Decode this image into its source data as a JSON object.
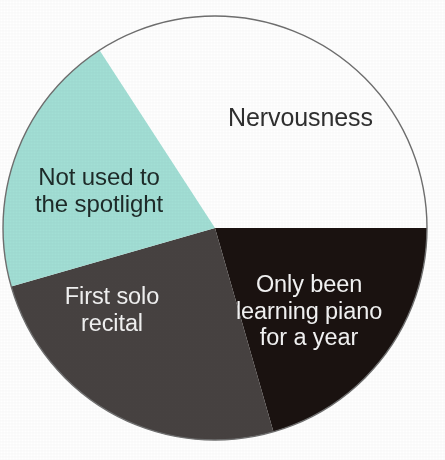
{
  "chart_data": {
    "type": "pie",
    "title": "",
    "subtitle": "",
    "xlabel": "",
    "ylabel": "",
    "legend_position": "none",
    "labels_inside_slices": true,
    "grid": false,
    "background_color": "#ffffff",
    "center": {
      "x": 215,
      "y": 228
    },
    "radius": 212,
    "outline_color": "#6f6f6f",
    "categories": [
      "Nervousness",
      "Only been learning piano for a year",
      "First solo recital",
      "Not used to the spotlight"
    ],
    "values": [
      34.2,
      20.6,
      25.0,
      20.2
    ],
    "slices": [
      {
        "label": "Nervousness",
        "label_lines": "Nervousness",
        "value": 34.2,
        "start_angle": 327,
        "end_angle": 90,
        "sweep": 123,
        "fill": "#ffffff",
        "text_color": "#2f2f2f",
        "has_outline": true
      },
      {
        "label": "Only been learning piano for a year",
        "label_lines": "Only been\nlearning piano\nfor a year",
        "value": 20.6,
        "start_angle": 90,
        "end_angle": 164,
        "sweep": 74,
        "fill": "#1a1210",
        "text_color": "#f4f4f4",
        "has_outline": false
      },
      {
        "label": "First solo recital",
        "label_lines": "First solo\nrecital",
        "value": 25.0,
        "start_angle": 164,
        "end_angle": 254,
        "sweep": 90,
        "fill": "#474241",
        "text_color": "#f2f2f2",
        "has_outline": false
      },
      {
        "label": "Not used to the spotlight",
        "label_lines": "Not used to\nthe spotlight",
        "value": 20.2,
        "start_angle": 254,
        "end_angle": 327,
        "sweep": 73,
        "fill": "#a2dfd5",
        "text_color": "#1d2a28",
        "has_outline": false
      }
    ],
    "colors": {
      "nervousness": "#ffffff",
      "piano": "#1a1210",
      "recital": "#474241",
      "spotlight": "#a2dfd5",
      "outline": "#6f6f6f",
      "background": "#ffffff"
    }
  }
}
